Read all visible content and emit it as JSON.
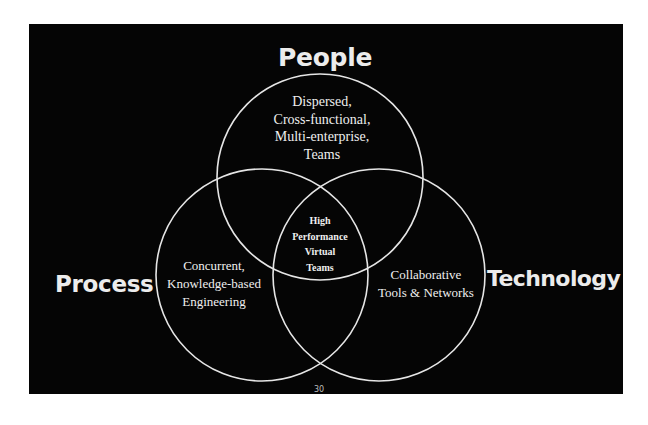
{
  "diagram": {
    "type": "venn",
    "background_color": "#050505",
    "line_color": "#e6e6e6",
    "text_color": "#efefef",
    "sets": [
      {
        "id": "people",
        "label": "People"
      },
      {
        "id": "process",
        "label": "Process"
      },
      {
        "id": "technology",
        "label": "Technology"
      }
    ],
    "regions": {
      "people": [
        "Dispersed,",
        "Cross-functional,",
        "Multi-enterprise,",
        "Teams"
      ],
      "process": [
        "Concurrent,",
        "Knowledge-based",
        "Engineering"
      ],
      "technology": [
        "Collaborative",
        "Tools & Networks"
      ],
      "center": [
        "High",
        "Performance",
        "Virtual",
        "Teams"
      ]
    },
    "page_number": "30"
  }
}
